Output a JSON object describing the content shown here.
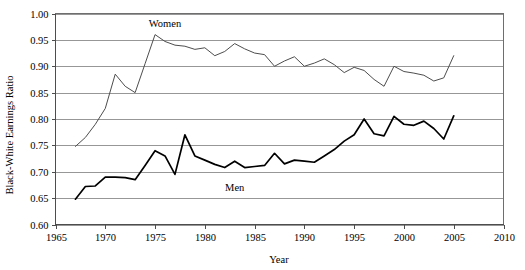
{
  "chart_data": {
    "type": "line",
    "title": "",
    "xlabel": "Year",
    "ylabel": "Black-White Earnings Ratio",
    "xlim": [
      1965,
      2010
    ],
    "ylim": [
      0.6,
      1.0
    ],
    "xticks": [
      1965,
      1970,
      1975,
      1980,
      1985,
      1990,
      1995,
      2000,
      2005,
      2010
    ],
    "xtick_labels": [
      "1965",
      "1970",
      "1975",
      "1980",
      "1985",
      "1990",
      "1995",
      "2000",
      "2005",
      "2010"
    ],
    "yticks": [
      0.6,
      0.65,
      0.7,
      0.75,
      0.8,
      0.85,
      0.9,
      0.95,
      1.0
    ],
    "ytick_labels": [
      "0.60",
      "0.65",
      "0.70",
      "0.75",
      "0.80",
      "0.85",
      "0.90",
      "0.95",
      "1.00"
    ],
    "grid": true,
    "grid_axis": "y",
    "legend": "inline-annotations",
    "series": [
      {
        "name": "Women",
        "label": "Women",
        "color": "#4d4d4d",
        "stroke_width": 1.0,
        "annotation": {
          "text": "Women",
          "x": 1976.0,
          "y": 0.975
        },
        "x": [
          1967,
          1968,
          1969,
          1970,
          1971,
          1972,
          1973,
          1974,
          1975,
          1976,
          1977,
          1978,
          1979,
          1980,
          1981,
          1982,
          1983,
          1984,
          1985,
          1986,
          1987,
          1988,
          1989,
          1990,
          1991,
          1992,
          1993,
          1994,
          1995,
          1996,
          1997,
          1998,
          1999,
          2000,
          2001,
          2002,
          2003,
          2004,
          2005
        ],
        "y": [
          0.748,
          0.765,
          0.79,
          0.82,
          0.885,
          0.862,
          0.85,
          0.905,
          0.96,
          0.947,
          0.94,
          0.938,
          0.932,
          0.935,
          0.92,
          0.928,
          0.943,
          0.933,
          0.925,
          0.922,
          0.9,
          0.91,
          0.918,
          0.9,
          0.906,
          0.914,
          0.903,
          0.888,
          0.898,
          0.892,
          0.875,
          0.862,
          0.9,
          0.89,
          0.887,
          0.883,
          0.872,
          0.878,
          0.92
        ]
      },
      {
        "name": "Men",
        "label": "Men",
        "color": "#000000",
        "stroke_width": 1.7,
        "annotation": {
          "text": "Men",
          "x": 1983.0,
          "y": 0.664
        },
        "x": [
          1967,
          1968,
          1969,
          1970,
          1971,
          1972,
          1973,
          1974,
          1975,
          1976,
          1977,
          1978,
          1979,
          1980,
          1981,
          1982,
          1983,
          1984,
          1985,
          1986,
          1987,
          1988,
          1989,
          1990,
          1991,
          1992,
          1993,
          1994,
          1995,
          1996,
          1997,
          1998,
          1999,
          2000,
          2001,
          2002,
          2003,
          2004,
          2005
        ],
        "y": [
          0.648,
          0.672,
          0.673,
          0.69,
          0.69,
          0.689,
          0.685,
          0.712,
          0.74,
          0.73,
          0.695,
          0.77,
          0.73,
          0.722,
          0.714,
          0.708,
          0.72,
          0.708,
          0.71,
          0.712,
          0.735,
          0.715,
          0.722,
          0.72,
          0.718,
          0.73,
          0.742,
          0.758,
          0.77,
          0.8,
          0.772,
          0.768,
          0.805,
          0.79,
          0.788,
          0.796,
          0.782,
          0.762,
          0.806
        ]
      }
    ]
  },
  "axes": {
    "y_axis_title": "Black-White Earnings Ratio",
    "x_axis_title": "Year"
  }
}
